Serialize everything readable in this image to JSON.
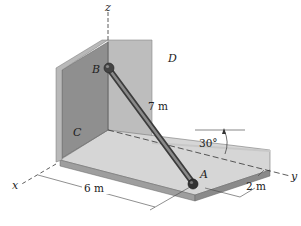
{
  "figure": {
    "labels": {
      "z_axis": "z",
      "x_axis": "x",
      "y_axis": "y",
      "point_b": "B",
      "point_a": "A",
      "wall_c": "C",
      "wall_d": "D"
    },
    "dimensions": {
      "rod_length": "7 m",
      "x_distance": "6 m",
      "y_offset": "2 m",
      "angle": "30°"
    },
    "colors": {
      "wall_c": "#8f8f8f",
      "wall_d": "#bdbdbd",
      "floor_top": "#d6d6d6",
      "floor_edge": "#9e9e9e",
      "rod": "#5a5a5a"
    }
  }
}
